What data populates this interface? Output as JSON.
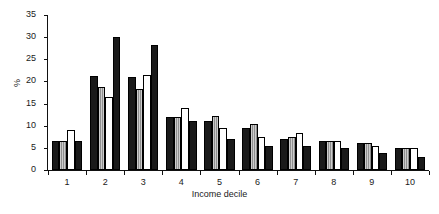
{
  "chart_data": {
    "type": "bar",
    "title": "",
    "xlabel": "Income decile",
    "ylabel": "%",
    "ylim": [
      0,
      35
    ],
    "ytick_labels": [
      "0",
      "5",
      "10",
      "15",
      "20",
      "25",
      "30",
      "35"
    ],
    "yticks": [
      0,
      5,
      10,
      15,
      20,
      25,
      30,
      35
    ],
    "grid": false,
    "legend": "none",
    "categories": [
      "1",
      "2",
      "3",
      "4",
      "5",
      "6",
      "7",
      "8",
      "9",
      "10"
    ],
    "series": [
      {
        "name": "series-1",
        "style": "black",
        "color": "#1a1a1a",
        "values": [
          6.5,
          21.2,
          21.0,
          12.0,
          11.0,
          9.5,
          7.0,
          6.5,
          6.0,
          5.0
        ]
      },
      {
        "name": "series-2",
        "style": "gray-hatched",
        "color": "#8f8f8f",
        "values": [
          6.5,
          18.8,
          18.3,
          12.0,
          12.2,
          10.5,
          7.5,
          6.5,
          6.2,
          5.0
        ]
      },
      {
        "name": "series-3",
        "style": "white",
        "color": "#ffffff",
        "values": [
          9.0,
          16.4,
          21.5,
          14.0,
          9.5,
          7.5,
          8.3,
          6.5,
          5.5,
          5.0
        ]
      },
      {
        "name": "series-4",
        "style": "black",
        "color": "#1a1a1a",
        "values": [
          6.5,
          30.1,
          28.3,
          11.0,
          7.0,
          5.5,
          5.5,
          5.0,
          3.8,
          3.0
        ]
      }
    ]
  }
}
